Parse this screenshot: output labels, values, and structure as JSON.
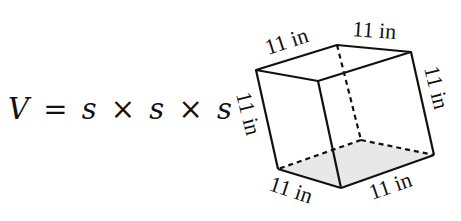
{
  "formula": {
    "lhs": "V",
    "equals": "=",
    "terms": [
      "s",
      "s",
      "s"
    ],
    "operator": "×"
  },
  "cube": {
    "edge_label": "11 in",
    "labels": {
      "top_left_edge": "11 in",
      "top_right_edge": "11 in",
      "right_vertical_edge": "11 in",
      "left_vertical_edge": "11 in",
      "bottom_left_edge": "11 in",
      "bottom_right_edge": "11 in"
    },
    "bottom_face_fill": "#e8e8e8",
    "stroke_color": "#111111"
  }
}
